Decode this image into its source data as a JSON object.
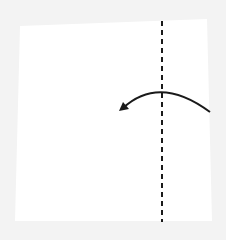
{
  "diagram": {
    "type": "origami-fold-step",
    "background_color": "#f3f3f3",
    "paper": {
      "color": "#ffffff",
      "corners": [
        [
          20,
          26
        ],
        [
          207,
          19
        ],
        [
          212,
          221
        ],
        [
          15,
          221
        ]
      ]
    },
    "fold_line": {
      "style": "valley-dashed",
      "color": "#1a1a1a",
      "x": 162,
      "y_start": 21,
      "y_end": 222
    },
    "fold_arrow": {
      "direction": "right-to-left",
      "color": "#1a1a1a",
      "start": [
        210,
        112
      ],
      "peak": [
        162,
        93
      ],
      "end": [
        119,
        111
      ]
    }
  }
}
